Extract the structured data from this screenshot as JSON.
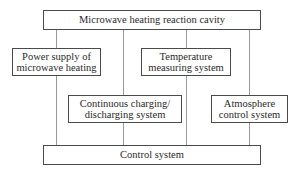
{
  "diagram": {
    "type": "block-diagram",
    "top": {
      "label": "Microwave heating reaction cavity"
    },
    "bottom": {
      "label": "Control system"
    },
    "modules": [
      {
        "id": "power",
        "line1": "Power supply of",
        "line2": "microwave heating"
      },
      {
        "id": "temperature",
        "line1": "Temperature",
        "line2": "measuring system"
      },
      {
        "id": "charging",
        "line1": "Continuous charging/",
        "line2": "discharging system"
      },
      {
        "id": "atmosphere",
        "line1": "Atmosphere",
        "line2": "control system"
      }
    ],
    "connections": [
      {
        "from": "Microwave heating reaction cavity",
        "to": "Power supply of microwave heating"
      },
      {
        "from": "Microwave heating reaction cavity",
        "to": "Continuous charging/discharging system"
      },
      {
        "from": "Microwave heating reaction cavity",
        "to": "Temperature measuring system"
      },
      {
        "from": "Microwave heating reaction cavity",
        "to": "Atmosphere control system"
      },
      {
        "from": "Power supply of microwave heating",
        "to": "Control system"
      },
      {
        "from": "Continuous charging/discharging system",
        "to": "Control system"
      },
      {
        "from": "Temperature measuring system",
        "to": "Control system"
      },
      {
        "from": "Atmosphere control system",
        "to": "Control system"
      }
    ]
  }
}
